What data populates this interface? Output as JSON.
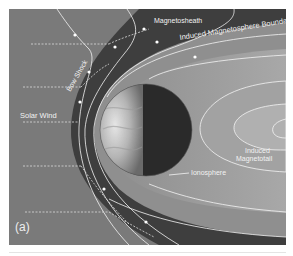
{
  "figure": {
    "panel_label": "(a)",
    "labels": {
      "magnetosheath": "Magnetosheath",
      "induced_magnetosphere_boundary": "Induced Magnetosphere Boundary",
      "bow_shock": "Bow Shock",
      "solar_wind": "Solar Wind",
      "induced_magnetotail_line1": "Induced",
      "induced_magnetotail_line2": "Magnetotail",
      "ionosphere": "Ionosphere"
    },
    "colors": {
      "solar_wind_region": "#7a7a7a",
      "magnetosheath_region": "#3e3e3e",
      "magnetosphere_region": "#9a9a9a",
      "planet_day": "#c8c8c8",
      "planet_night": "#2a2a2a",
      "field_lines": "#f4f4f4"
    }
  }
}
